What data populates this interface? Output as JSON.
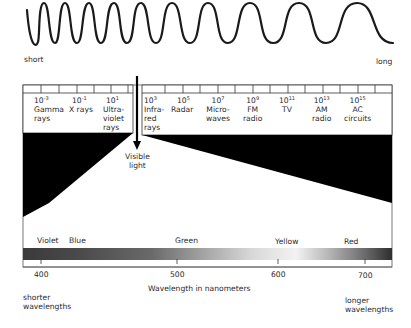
{
  "wave": {
    "left_label": "short",
    "right_label": "long"
  },
  "spectrum": {
    "left_bands": [
      {
        "exponent": "-3",
        "base": "10",
        "name_lines": [
          "Gamma",
          "rays"
        ]
      },
      {
        "exponent": "-1",
        "base": "10",
        "name_lines": [
          "X rays"
        ]
      },
      {
        "exponent": "1",
        "base": "10",
        "name_lines": [
          "Ultra-",
          "violet",
          "rays"
        ]
      }
    ],
    "right_bands": [
      {
        "exponent": "3",
        "base": "10",
        "name_lines": [
          "Infra-",
          "red",
          "rays"
        ]
      },
      {
        "exponent": "5",
        "base": "10",
        "name_lines": [
          "Radar"
        ]
      },
      {
        "exponent": "7",
        "base": "10",
        "name_lines": [
          "Micro-",
          "waves"
        ]
      },
      {
        "exponent": "9",
        "base": "10",
        "name_lines": [
          "FM",
          "radio"
        ]
      },
      {
        "exponent": "11",
        "base": "10",
        "name_lines": [
          "TV"
        ]
      },
      {
        "exponent": "13",
        "base": "10",
        "name_lines": [
          "AM",
          "radio"
        ]
      },
      {
        "exponent": "15",
        "base": "10",
        "name_lines": [
          "AC",
          "circuits"
        ]
      }
    ],
    "visible_label_lines": [
      "Visible",
      "light"
    ]
  },
  "visible": {
    "colors": [
      "Violet",
      "Blue",
      "Green",
      "Yellow",
      "Red"
    ],
    "ticks": [
      "400",
      "500",
      "600",
      "700"
    ],
    "axis_label": "Wavelength in nanometers",
    "left_note_lines": [
      "shorter",
      "wavelengths"
    ],
    "right_note_lines": [
      "longer",
      "wavelengths"
    ]
  }
}
